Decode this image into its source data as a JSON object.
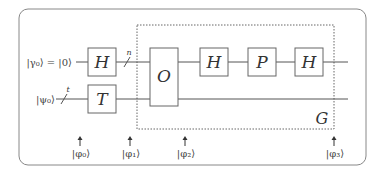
{
  "diagram": {
    "type": "quantum-circuit",
    "inputs": [
      {
        "label": "|γ₀⟩ = |0⟩",
        "wire_size": "n"
      },
      {
        "label": "|ψ₀⟩",
        "wire_size": "t"
      }
    ],
    "gates": {
      "h1": "H",
      "t": "T",
      "oracle": "O",
      "h2": "H",
      "p": "P",
      "h3": "H"
    },
    "group_label": "G",
    "states": [
      "|φ₀⟩",
      "|φ₁⟩",
      "|φ₂⟩",
      "|φ₃⟩"
    ],
    "colors": {
      "line": "#555555",
      "gate_border": "#666666",
      "frame": "#777777"
    }
  }
}
